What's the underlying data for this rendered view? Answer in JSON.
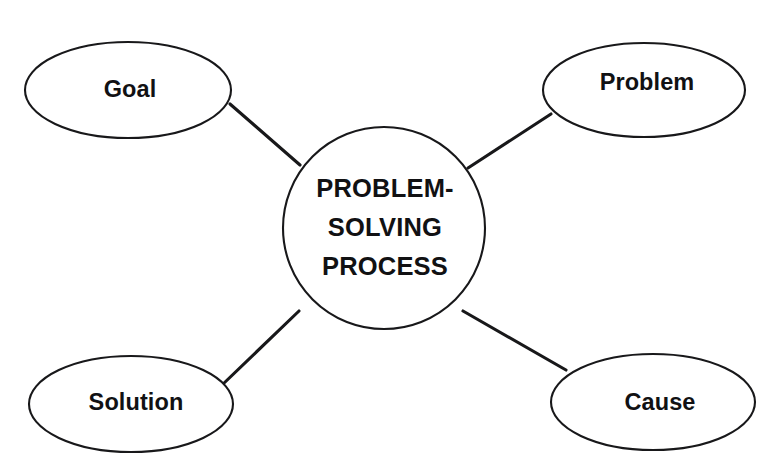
{
  "diagram": {
    "type": "concept-map",
    "background_color": "#ffffff",
    "stroke_color": "#18181a",
    "text_color": "#111113",
    "hub": {
      "shape": "circle",
      "lines": [
        "PROBLEM-",
        "SOLVING",
        "PROCESS"
      ],
      "line1": "PROBLEM-",
      "line2": "SOLVING",
      "line3": "PROCESS",
      "cx": 384,
      "cy": 228,
      "r": 101
    },
    "nodes": [
      {
        "id": "goal",
        "label": "Goal",
        "position": "top-left",
        "shape": "ellipse",
        "cx": 128,
        "cy": 90,
        "rx": 103,
        "ry": 48,
        "label_x": 130,
        "label_y": 91
      },
      {
        "id": "problem",
        "label": "Problem",
        "position": "top-right",
        "shape": "ellipse",
        "cx": 644,
        "cy": 90,
        "rx": 101,
        "ry": 47,
        "label_x": 647,
        "label_y": 84
      },
      {
        "id": "solution",
        "label": "Solution",
        "position": "bottom-left",
        "shape": "ellipse",
        "cx": 131,
        "cy": 404,
        "rx": 102,
        "ry": 48,
        "label_x": 136,
        "label_y": 404
      },
      {
        "id": "cause",
        "label": "Cause",
        "position": "bottom-right",
        "shape": "ellipse",
        "cx": 653,
        "cy": 402,
        "rx": 102,
        "ry": 48,
        "label_x": 660,
        "label_y": 404
      }
    ],
    "connectors": [
      {
        "id": "hub-goal",
        "from": "problem-solving-process",
        "to": "goal",
        "x1": 300,
        "y1": 165,
        "x2": 230,
        "y2": 104
      },
      {
        "id": "hub-problem",
        "from": "problem-solving-process",
        "to": "problem",
        "x1": 468,
        "y1": 168,
        "x2": 551,
        "y2": 114
      },
      {
        "id": "hub-solution",
        "from": "problem-solving-process",
        "to": "solution",
        "x1": 299,
        "y1": 311,
        "x2": 222,
        "y2": 385
      },
      {
        "id": "hub-cause",
        "from": "problem-solving-process",
        "to": "cause",
        "x1": 463,
        "y1": 311,
        "x2": 566,
        "y2": 370
      }
    ]
  }
}
